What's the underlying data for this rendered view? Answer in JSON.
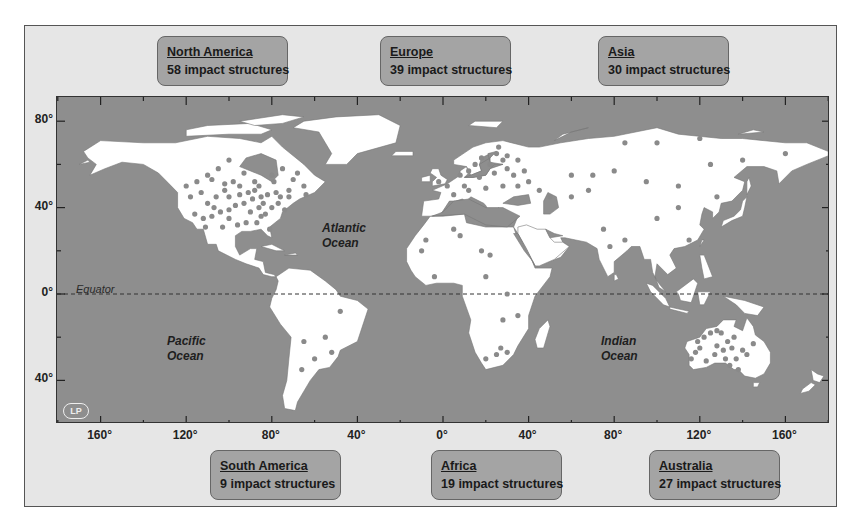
{
  "regions": [
    {
      "id": "north-america",
      "name": "North America",
      "count": "58 impact structures",
      "x": 157,
      "y": 36
    },
    {
      "id": "europe",
      "name": "Europe",
      "count": "39 impact structures",
      "x": 380,
      "y": 36
    },
    {
      "id": "asia",
      "name": "Asia",
      "count": "30 impact structures",
      "x": 598,
      "y": 36
    },
    {
      "id": "south-america",
      "name": "South America",
      "count": "9 impact structures",
      "x": 210,
      "y": 450
    },
    {
      "id": "africa",
      "name": "Africa",
      "count": "19 impact structures",
      "x": 431,
      "y": 450
    },
    {
      "id": "australia",
      "name": "Australia",
      "count": "27 impact structures",
      "x": 649,
      "y": 450
    }
  ],
  "axes": {
    "y_labels": [
      {
        "text": "80°",
        "lat": 80
      },
      {
        "text": "40°",
        "lat": 40
      },
      {
        "text": "0°",
        "lat": 0
      },
      {
        "text": "40°",
        "lat": -40
      }
    ],
    "x_labels": [
      {
        "text": "160°",
        "lon": -160
      },
      {
        "text": "120°",
        "lon": -120
      },
      {
        "text": "80°",
        "lon": -80
      },
      {
        "text": "40°",
        "lon": -40
      },
      {
        "text": "0°",
        "lon": 0
      },
      {
        "text": "40°",
        "lon": 40
      },
      {
        "text": "80°",
        "lon": 80
      },
      {
        "text": "120°",
        "lon": 120
      },
      {
        "text": "160°",
        "lon": 160
      }
    ]
  },
  "labels": {
    "equator": "Equator",
    "atlantic": [
      "Atlantic",
      "Ocean"
    ],
    "pacific": [
      "Pacific",
      "Ocean"
    ],
    "indian": [
      "Indian",
      "Ocean"
    ],
    "logo": "LP"
  },
  "colors": {
    "ocean": "#8e8e8e",
    "land": "#ffffff",
    "crater": "#8a8a8a",
    "region_box": "#a4a4a4"
  },
  "craters": [
    [
      -105,
      58
    ],
    [
      -110,
      55
    ],
    [
      -100,
      62
    ],
    [
      -93,
      56
    ],
    [
      -115,
      52
    ],
    [
      -95,
      50
    ],
    [
      -102,
      51
    ],
    [
      -88,
      52
    ],
    [
      -80,
      55
    ],
    [
      -75,
      58
    ],
    [
      -70,
      53
    ],
    [
      -68,
      56
    ],
    [
      -65,
      50
    ],
    [
      -72,
      48
    ],
    [
      -78,
      47
    ],
    [
      -82,
      46
    ],
    [
      -85,
      45
    ],
    [
      -89,
      44
    ],
    [
      -93,
      42
    ],
    [
      -97,
      41
    ],
    [
      -100,
      39
    ],
    [
      -104,
      38
    ],
    [
      -108,
      36
    ],
    [
      -112,
      35
    ],
    [
      -116,
      37
    ],
    [
      -110,
      42
    ],
    [
      -106,
      45
    ],
    [
      -113,
      47
    ],
    [
      -100,
      45
    ],
    [
      -90,
      38
    ],
    [
      -86,
      40
    ],
    [
      -83,
      37
    ],
    [
      -87,
      33
    ],
    [
      -92,
      33
    ],
    [
      -96,
      32
    ],
    [
      -103,
      31
    ],
    [
      -80,
      40
    ],
    [
      -77,
      42
    ],
    [
      -95,
      46
    ],
    [
      -98,
      52
    ],
    [
      -86,
      50
    ],
    [
      -76,
      45
    ],
    [
      -72,
      45
    ],
    [
      -64,
      46
    ],
    [
      -120,
      50
    ],
    [
      -118,
      45
    ],
    [
      -85,
      36
    ],
    [
      -81,
      30
    ],
    [
      -88,
      48
    ],
    [
      -100,
      35
    ],
    [
      -107,
      40
    ],
    [
      -91,
      47
    ],
    [
      -102,
      48
    ],
    [
      -108,
      53
    ],
    [
      -79,
      52
    ],
    [
      -84,
      42
    ],
    [
      -74,
      39
    ],
    [
      -111,
      31
    ],
    [
      25,
      65
    ],
    [
      28,
      62
    ],
    [
      22,
      60
    ],
    [
      30,
      58
    ],
    [
      15,
      60
    ],
    [
      18,
      63
    ],
    [
      12,
      57
    ],
    [
      24,
      56
    ],
    [
      33,
      55
    ],
    [
      38,
      57
    ],
    [
      40,
      52
    ],
    [
      35,
      50
    ],
    [
      28,
      50
    ],
    [
      20,
      49
    ],
    [
      12,
      48
    ],
    [
      5,
      46
    ],
    [
      10,
      50
    ],
    [
      17,
      54
    ],
    [
      45,
      48
    ],
    [
      8,
      55
    ],
    [
      2,
      50
    ],
    [
      -2,
      52
    ],
    [
      26,
      68
    ],
    [
      30,
      64
    ],
    [
      35,
      62
    ],
    [
      60,
      55
    ],
    [
      70,
      55
    ],
    [
      80,
      57
    ],
    [
      95,
      52
    ],
    [
      110,
      50
    ],
    [
      125,
      60
    ],
    [
      140,
      62
    ],
    [
      120,
      72
    ],
    [
      100,
      70
    ],
    [
      85,
      70
    ],
    [
      160,
      65
    ],
    [
      110,
      40
    ],
    [
      128,
      45
    ],
    [
      75,
      30
    ],
    [
      78,
      22
    ],
    [
      85,
      25
    ],
    [
      100,
      35
    ],
    [
      115,
      25
    ],
    [
      60,
      45
    ],
    [
      68,
      48
    ],
    [
      50,
      45
    ],
    [
      5,
      30
    ],
    [
      8,
      27
    ],
    [
      -8,
      25
    ],
    [
      -10,
      20
    ],
    [
      18,
      20
    ],
    [
      22,
      18
    ],
    [
      20,
      8
    ],
    [
      28,
      -12
    ],
    [
      30,
      -27
    ],
    [
      27,
      -25
    ],
    [
      25,
      -28
    ],
    [
      20,
      -30
    ],
    [
      30,
      0
    ],
    [
      35,
      -10
    ],
    [
      -4,
      8
    ],
    [
      -48,
      -8
    ],
    [
      -55,
      -20
    ],
    [
      -65,
      -22
    ],
    [
      -60,
      -30
    ],
    [
      -66,
      -35
    ],
    [
      -52,
      -27
    ],
    [
      122,
      -20
    ],
    [
      125,
      -18
    ],
    [
      128,
      -17
    ],
    [
      130,
      -18
    ],
    [
      133,
      -22
    ],
    [
      135,
      -25
    ],
    [
      137,
      -30
    ],
    [
      140,
      -26
    ],
    [
      120,
      -25
    ],
    [
      118,
      -27
    ],
    [
      116,
      -30
    ],
    [
      127,
      -28
    ],
    [
      132,
      -30
    ],
    [
      134,
      -33
    ],
    [
      138,
      -35
    ],
    [
      145,
      -23
    ],
    [
      142,
      -28
    ],
    [
      119,
      -22
    ],
    [
      123,
      -31
    ],
    [
      128,
      -24
    ],
    [
      136,
      -20
    ],
    [
      131,
      -26
    ]
  ]
}
